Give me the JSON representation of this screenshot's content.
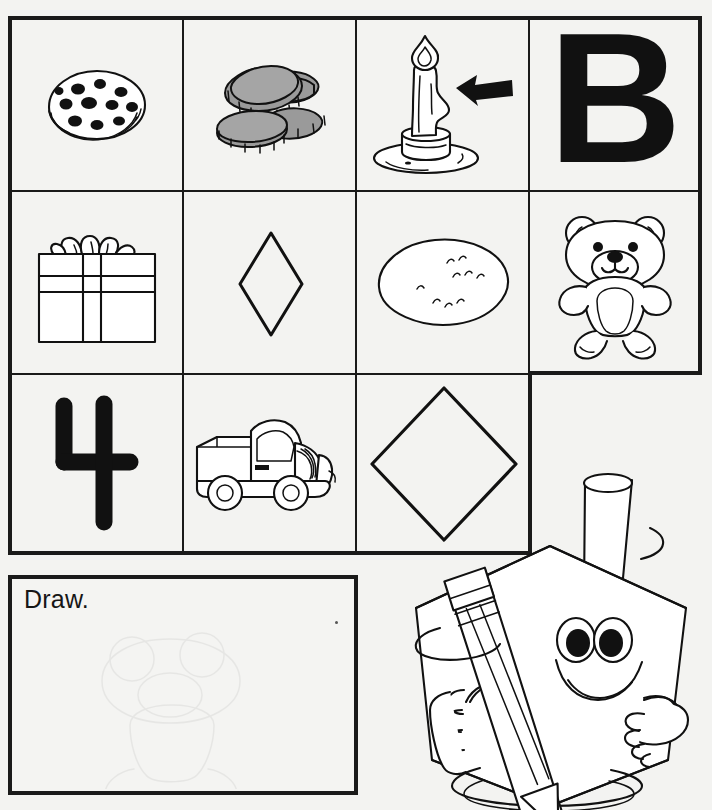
{
  "worksheet": {
    "title": "Kindergarten picture grid worksheet",
    "background_color": "#f3f3f1",
    "ink_color": "#111111"
  },
  "grid": {
    "columns": 4,
    "rows": 3,
    "note": "row 3 has only 3 cells; bottom-right cell is absent",
    "cells": [
      {
        "row": 1,
        "col": 1,
        "icon": "cookie-icon",
        "label": "cookie",
        "marked": false
      },
      {
        "row": 1,
        "col": 2,
        "icon": "coins-icon",
        "label": "coins",
        "marked": false
      },
      {
        "row": 1,
        "col": 3,
        "icon": "candle-icon",
        "label": "candle",
        "marked": true
      },
      {
        "row": 1,
        "col": 4,
        "icon": "letter-b-icon",
        "label": "B",
        "marked": false
      },
      {
        "row": 2,
        "col": 1,
        "icon": "gift-icon",
        "label": "present",
        "marked": false
      },
      {
        "row": 2,
        "col": 2,
        "icon": "small-diamond-icon",
        "label": "diamond",
        "marked": false
      },
      {
        "row": 2,
        "col": 3,
        "icon": "potato-icon",
        "label": "potato",
        "marked": false
      },
      {
        "row": 2,
        "col": 4,
        "icon": "teddy-bear-icon",
        "label": "teddy bear",
        "marked": false
      },
      {
        "row": 3,
        "col": 1,
        "icon": "number-four-icon",
        "label": "4",
        "marked": false
      },
      {
        "row": 3,
        "col": 2,
        "icon": "truck-icon",
        "label": "truck",
        "marked": false
      },
      {
        "row": 3,
        "col": 3,
        "icon": "large-diamond-icon",
        "label": "diamond",
        "marked": false
      }
    ],
    "marker": {
      "icon": "arrow-left-icon",
      "points_to": "candle"
    }
  },
  "draw_box": {
    "instruction": "Draw.",
    "content": ""
  },
  "mascot": {
    "name": "diamond-character",
    "shape": "diamond",
    "accessories": [
      "cylinder-hat",
      "pencil"
    ],
    "expression": "smiling"
  }
}
